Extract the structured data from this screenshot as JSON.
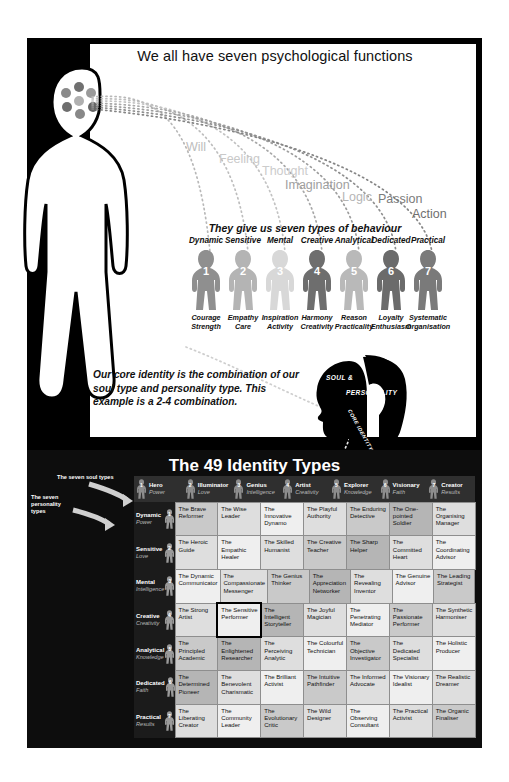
{
  "top": {
    "headline": "We all have seven psychological functions",
    "behaviour_head": "They give us seven types of behaviour",
    "functions": [
      {
        "label": "Will"
      },
      {
        "label": "Feeling"
      },
      {
        "label": "Thought"
      },
      {
        "label": "Imagination"
      },
      {
        "label": "Logic"
      },
      {
        "label": "Passion"
      },
      {
        "label": "Action"
      }
    ],
    "behaviour_types": [
      {
        "num": "1",
        "name": "Dynamic",
        "qualities": "Courage\nStrength",
        "color": "#8f8f8f"
      },
      {
        "num": "2",
        "name": "Sensitive",
        "qualities": "Empathy\nCare",
        "color": "#b4b4b4"
      },
      {
        "num": "3",
        "name": "Mental",
        "qualities": "Inspiration\nActivity",
        "color": "#d8d8d8"
      },
      {
        "num": "4",
        "name": "Creative",
        "qualities": "Harmony\nCreativity",
        "color": "#6e6e6e"
      },
      {
        "num": "5",
        "name": "Analytical",
        "qualities": "Reason\nPracticality",
        "color": "#b9b9b9"
      },
      {
        "num": "6",
        "name": "Dedicated",
        "qualities": "Loyalty\nEnthusiasm",
        "color": "#6b6b6b"
      },
      {
        "num": "7",
        "name": "Practical",
        "qualities": "Systematic\nOrganisation",
        "color": "#7a7a7a"
      }
    ],
    "core_text": "Our core identity is the combination of our soul type and personality type. This example is a 2-4 combination.",
    "soul_label": "SOUL &",
    "personality_label": "PERSONALITY",
    "core_identity_label": "CORE IDENTITY"
  },
  "table": {
    "title": "The 49 Identity Types",
    "soul_annotation": "The seven soul types",
    "personality_annotation": "The seven\npersonality\ntypes",
    "columns": [
      {
        "num": "1",
        "name": "Hero",
        "sub": "Power"
      },
      {
        "num": "2",
        "name": "Illuminator",
        "sub": "Love"
      },
      {
        "num": "3",
        "name": "Genius",
        "sub": "Intelligence"
      },
      {
        "num": "4",
        "name": "Artist",
        "sub": "Creativity"
      },
      {
        "num": "5",
        "name": "Explorer",
        "sub": "Knowledge"
      },
      {
        "num": "6",
        "name": "Visionary",
        "sub": "Faith"
      },
      {
        "num": "7",
        "name": "Creator",
        "sub": "Results"
      }
    ],
    "rows": [
      {
        "num": "1",
        "name": "Dynamic",
        "sub": "Power",
        "cells": [
          "The Brave Reformer",
          "The Wise Leader",
          "The Innovative Dynamo",
          "The Playful Authority",
          "The Enduring Detective",
          "The One-pointed Soldier",
          "The Organising Manager"
        ]
      },
      {
        "num": "2",
        "name": "Sensitive",
        "sub": "Love",
        "cells": [
          "The Heroic Guide",
          "The Empathic Healer",
          "The Skilled Humanist",
          "The Creative Teacher",
          "The Sharp Helper",
          "The Committed Heart",
          "The Coordinating Advisor"
        ]
      },
      {
        "num": "3",
        "name": "Mental",
        "sub": "Intelligence",
        "cells": [
          "The Dynamic Communicator",
          "The Compassionate Messenger",
          "The Genius Thinker",
          "The Appreciation Networker",
          "The Revealing Inventor",
          "The Genuine Advisor",
          "The Leading Strategist"
        ]
      },
      {
        "num": "4",
        "name": "Creative",
        "sub": "Creativity",
        "cells": [
          "The Strong Artist",
          "The Sensitive Performer",
          "The Intelligent Storyteller",
          "The Joyful Magician",
          "The Penetrating Mediator",
          "The Passionate Performer",
          "The Synthetic Harmoniser"
        ]
      },
      {
        "num": "5",
        "name": "Analytical",
        "sub": "Knowledge",
        "cells": [
          "The Principled Academic",
          "The Enlightened Researcher",
          "The Perceiving Analytic",
          "The Colourful Technician",
          "The Objective Investigator",
          "The Dedicated Specialist",
          "The Holistic Producer"
        ]
      },
      {
        "num": "6",
        "name": "Dedicated",
        "sub": "Faith",
        "cells": [
          "The Determined Pioneer",
          "The Benevolent Charismatic",
          "The Brilliant Activist",
          "The Intuitive Pathfinder",
          "The Informed Advocate",
          "The Visionary Idealist",
          "The Realistic Dreamer"
        ]
      },
      {
        "num": "7",
        "name": "Practical",
        "sub": "Results",
        "cells": [
          "The Liberating Creator",
          "The Community Leader",
          "The Evolutionary Critic",
          "The Wild Designer",
          "The Observing Consultant",
          "The Practical Activist",
          "The Organic Finaliser"
        ]
      }
    ],
    "highlight": {
      "row": 3,
      "col": 1
    }
  },
  "colors": {
    "panel_bg": "#000000",
    "table_bg": "#0d0d0d",
    "accent_white": "#ffffff"
  }
}
